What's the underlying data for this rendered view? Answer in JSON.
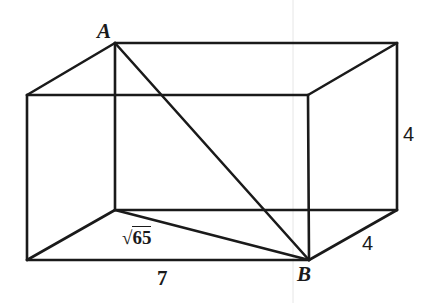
{
  "figure": {
    "type": "rectangular-prism",
    "vertices": {
      "A": {
        "label": "A",
        "x": 115,
        "y": 43
      },
      "back_top_right": {
        "x": 397,
        "y": 43
      },
      "front_top_left": {
        "x": 27,
        "y": 95
      },
      "front_top_right": {
        "x": 308,
        "y": 95
      },
      "back_bottom_left": {
        "x": 115,
        "y": 210
      },
      "back_bottom_right": {
        "x": 397,
        "y": 210
      },
      "front_bottom_left": {
        "x": 27,
        "y": 260
      },
      "B": {
        "label": "B",
        "x": 309,
        "y": 260
      }
    },
    "labels": {
      "vertex_a": "A",
      "vertex_b": "B",
      "height": "4",
      "depth": "4",
      "length": "7",
      "base_diagonal_radicand": "65",
      "base_diagonal_radical": "√"
    },
    "stroke_color": "#1a1a1a",
    "background": "#ffffff"
  }
}
